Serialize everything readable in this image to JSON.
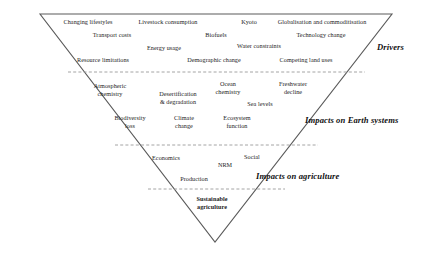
{
  "diagram": {
    "shape": {
      "type": "inverted-triangle",
      "apex_left": [
        40,
        14
      ],
      "apex_right": [
        392,
        14
      ],
      "apex_bottom": [
        215,
        242
      ],
      "stroke_color": "#5a5a5a",
      "fill_color": "#ffffff"
    },
    "dividers": [
      {
        "name": "drivers-earth-divider",
        "y": 72,
        "x1": 68,
        "x2": 365,
        "style": "dashed",
        "color": "#9a9a9a"
      },
      {
        "name": "earth-agriculture-divider",
        "y": 145,
        "x1": 115,
        "x2": 318,
        "style": "dashed",
        "color": "#9a9a9a"
      },
      {
        "name": "agriculture-sustainable-divider",
        "y": 189,
        "x1": 148,
        "x2": 285,
        "style": "dashed",
        "color": "#9a9a9a"
      }
    ],
    "bands": [
      {
        "id": "drivers",
        "label": "Drivers",
        "label_x": 377,
        "label_y": 47,
        "items": [
          {
            "text": "Changing lifestyles",
            "x": 88,
            "y": 22
          },
          {
            "text": "Livestock consumption",
            "x": 168,
            "y": 22
          },
          {
            "text": "Kyoto",
            "x": 249,
            "y": 22
          },
          {
            "text": "Globalisation and commoditisation",
            "x": 322,
            "y": 22
          },
          {
            "text": "Transport costs",
            "x": 112,
            "y": 35
          },
          {
            "text": "Biofuels",
            "x": 216,
            "y": 35
          },
          {
            "text": "Technology change",
            "x": 321,
            "y": 35
          },
          {
            "text": "Energy usage",
            "x": 164,
            "y": 48
          },
          {
            "text": "Water constraints",
            "x": 259,
            "y": 46
          },
          {
            "text": "Resource limitations",
            "x": 103,
            "y": 60
          },
          {
            "text": "Demographic change",
            "x": 214,
            "y": 60
          },
          {
            "text": "Competing land uses",
            "x": 306,
            "y": 60
          }
        ]
      },
      {
        "id": "earth-systems",
        "label": "Impacts on Earth systems",
        "label_x": 305,
        "label_y": 120,
        "items": [
          {
            "text": "Atmospheric\nchemistry",
            "x": 110,
            "y": 90
          },
          {
            "text": "Desertification\n& degradation",
            "x": 178,
            "y": 98
          },
          {
            "text": "Ocean\nchemistry",
            "x": 228,
            "y": 88
          },
          {
            "text": "Freshwater\ndecline",
            "x": 293,
            "y": 88
          },
          {
            "text": "Sea levels",
            "x": 260,
            "y": 104
          },
          {
            "text": "Biodiversity\nloss",
            "x": 130,
            "y": 122
          },
          {
            "text": "Climate\nchange",
            "x": 184,
            "y": 122
          },
          {
            "text": "Ecosystem\nfunction",
            "x": 237,
            "y": 122
          }
        ]
      },
      {
        "id": "agriculture",
        "label": "Impacts on agriculture",
        "label_x": 256,
        "label_y": 176,
        "items": [
          {
            "text": "Economics",
            "x": 166,
            "y": 158
          },
          {
            "text": "NRM",
            "x": 225,
            "y": 165
          },
          {
            "text": "Social",
            "x": 252,
            "y": 157
          },
          {
            "text": "Production",
            "x": 194,
            "y": 179
          }
        ]
      },
      {
        "id": "sustainable",
        "label": "",
        "items": [
          {
            "text": "Sustainable\nagriculture",
            "x": 212,
            "y": 203,
            "bold": true
          }
        ]
      }
    ]
  }
}
